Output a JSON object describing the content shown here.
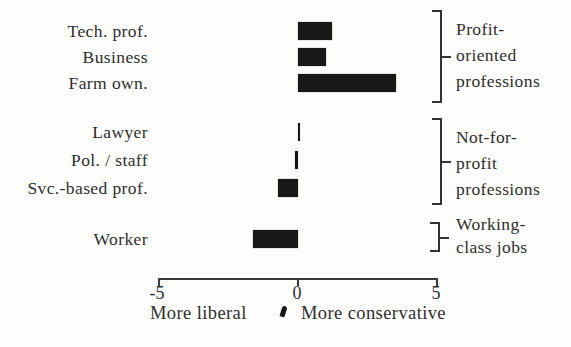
{
  "figure": {
    "background": "#fdfdfc",
    "bar_color": "#181818",
    "text_color": "#2e2e2e",
    "axis_color": "#3a3a3a"
  },
  "chart_data": {
    "type": "bar",
    "orientation": "horizontal",
    "title": "",
    "categories": [
      "Tech. prof.",
      "Business",
      "Farm own.",
      "Lawyer",
      "Pol. / staff",
      "Svc.-based prof.",
      "Worker"
    ],
    "values": [
      1.2,
      1.0,
      3.5,
      0.05,
      -0.1,
      -0.7,
      -1.6
    ],
    "xlim": [
      -5,
      5
    ],
    "x_ticks": [
      -5,
      0,
      5
    ],
    "x_tick_labels": [
      "-5",
      "0",
      "5"
    ],
    "axis_left_label": "More liberal",
    "axis_right_label": "More conservative",
    "grid": false,
    "legend": null,
    "groups": [
      {
        "label_lines": [
          "Profit-",
          "oriented",
          "professions"
        ],
        "rows": [
          0,
          1,
          2
        ]
      },
      {
        "label_lines": [
          "Not-for-",
          "profit",
          "professions"
        ],
        "rows": [
          3,
          4,
          5
        ]
      },
      {
        "label_lines": [
          "Working-",
          "class jobs"
        ],
        "rows": [
          6
        ]
      }
    ]
  }
}
